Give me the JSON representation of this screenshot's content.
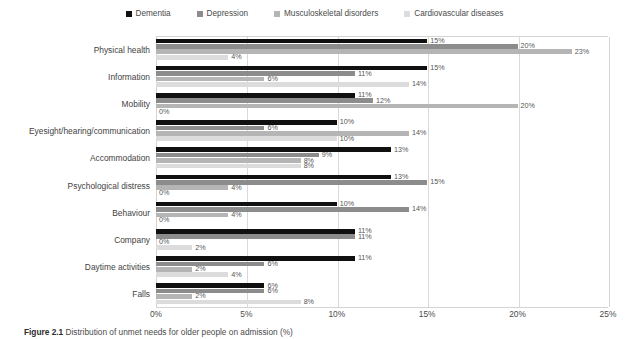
{
  "chart_data": {
    "type": "bar",
    "orientation": "horizontal",
    "title": "",
    "xlabel": "",
    "ylabel": "",
    "xlim": [
      0,
      25
    ],
    "xticks": [
      "0%",
      "5%",
      "10%",
      "15%",
      "20%",
      "25%"
    ],
    "xtick_values": [
      0,
      5,
      10,
      15,
      20,
      25
    ],
    "grid": true,
    "legend_position": "top-center",
    "value_suffix": "%",
    "categories": [
      "Physical health",
      "Information",
      "Mobility",
      "Eyesight/hearing/communication",
      "Accommodation",
      "Psychological distress",
      "Behaviour",
      "Company",
      "Daytime activities",
      "Falls"
    ],
    "series": [
      {
        "name": "Dementia",
        "color": "#101010",
        "values": [
          15,
          15,
          11,
          10,
          13,
          13,
          10,
          11,
          11,
          6
        ],
        "labels": [
          "15%",
          "15%",
          "11%",
          "10%",
          "13%",
          "13%",
          "10%",
          "11%",
          "11%",
          "6%"
        ]
      },
      {
        "name": "Depression",
        "color": "#8c8c8c",
        "values": [
          20,
          11,
          12,
          6,
          9,
          15,
          14,
          11,
          6,
          6
        ],
        "labels": [
          "20%",
          "11%",
          "12%",
          "6%",
          "9%",
          "15%",
          "14%",
          "11%",
          "6%",
          "6%"
        ]
      },
      {
        "name": "Musculoskeletal disorders",
        "color": "#b5b5b5",
        "values": [
          23,
          6,
          20,
          14,
          8,
          4,
          4,
          0,
          2,
          2
        ],
        "labels": [
          "23%",
          "6%",
          "20%",
          "14%",
          "8%",
          "4%",
          "4%",
          "0%",
          "2%",
          "2%"
        ]
      },
      {
        "name": "Cardiovascular diseases",
        "color": "#dcdcdc",
        "values": [
          4,
          14,
          0,
          10,
          8,
          0,
          0,
          2,
          4,
          8
        ],
        "labels": [
          "4%",
          "14%",
          "0%",
          "10%",
          "8%",
          "0%",
          "0%",
          "2%",
          "4%",
          "8%"
        ]
      }
    ]
  },
  "caption": {
    "figure_number": "Figure 2.1",
    "text": "Distribution of unmet needs for older people on admission (%)"
  }
}
